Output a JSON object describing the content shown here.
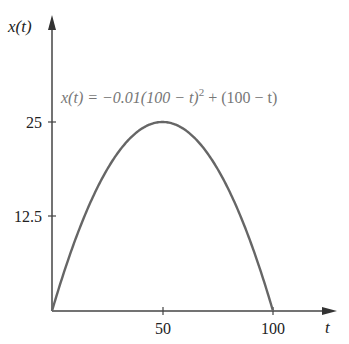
{
  "chart_data": {
    "type": "line",
    "title": "",
    "xlabel": "t",
    "ylabel": "x(t)",
    "xlim": [
      0,
      100
    ],
    "ylim": [
      0,
      25
    ],
    "x_ticks": [
      50,
      100
    ],
    "x_tick_labels": [
      "50",
      "100"
    ],
    "y_ticks": [
      12.5,
      25
    ],
    "y_tick_labels": [
      "12.5",
      "25"
    ],
    "grid": false,
    "legend": null,
    "annotations": [
      {
        "text_parts": [
          "x(t) = −0.01(100 − t)",
          "2",
          " + (100 − t)"
        ],
        "position": "top, right of peak"
      }
    ],
    "series": [
      {
        "name": "x(t) = -0.01(100 - t)^2 + (100 - t)",
        "x": [
          0,
          10,
          20,
          30,
          40,
          50,
          60,
          70,
          80,
          90,
          100
        ],
        "values": [
          0,
          9,
          16,
          21,
          24,
          25,
          24,
          21,
          16,
          9,
          0
        ],
        "color": "#666666"
      }
    ]
  },
  "labels": {
    "ylabel": "x(t)",
    "xlabel": "t",
    "eq_main": "x(t) = −0.01(100 − t)",
    "eq_sup": "2",
    "eq_tail": " + (100 − t)",
    "ytick_25": "25",
    "ytick_12_5": "12.5",
    "xtick_50": "50",
    "xtick_100": "100"
  }
}
